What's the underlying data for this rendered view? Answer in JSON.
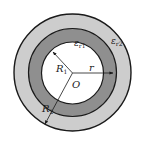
{
  "diagram": {
    "center_label": "O",
    "inner_radius_label": {
      "main": "R",
      "sub": "1"
    },
    "outer_radius_label": {
      "main": "R",
      "sub": "2"
    },
    "radial_label": "r",
    "layer1_label": {
      "main": "ε",
      "sub": "r1"
    },
    "layer2_label": {
      "main": "ε",
      "sub": "r2"
    },
    "colors": {
      "inner_core": "#ffffff",
      "layer1": "#8f8f8f",
      "layer2": "#cdcdcd",
      "stroke": "#1a1a1a"
    }
  }
}
